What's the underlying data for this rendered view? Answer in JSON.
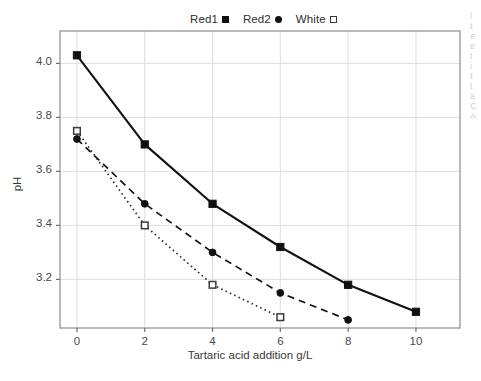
{
  "chart_data": {
    "type": "line",
    "title": "",
    "xlabel": "Tartaric acid addition g/L",
    "ylabel": "pH",
    "x": [
      0,
      2,
      4,
      6,
      8,
      10
    ],
    "xlim": [
      -0.5,
      11.3
    ],
    "ylim": [
      3.02,
      4.12
    ],
    "xticks": [
      "0",
      "2",
      "4",
      "6",
      "8",
      "10"
    ],
    "yticks": [
      "3.2",
      "3.4",
      "3.6",
      "3.8",
      "4.0"
    ],
    "grid": "both",
    "legend_position": "above-center",
    "series": [
      {
        "name": "Red1",
        "marker": "filled-square",
        "linestyle": "solid",
        "color": "#111111",
        "x": [
          0,
          2,
          4,
          6,
          8,
          10
        ],
        "values": [
          4.03,
          3.7,
          3.48,
          3.32,
          3.18,
          3.08
        ]
      },
      {
        "name": "Red2",
        "marker": "filled-circle",
        "linestyle": "dashed",
        "color": "#111111",
        "x": [
          0,
          2,
          4,
          6,
          8
        ],
        "values": [
          3.72,
          3.48,
          3.3,
          3.15,
          3.05
        ]
      },
      {
        "name": "White",
        "marker": "open-square",
        "linestyle": "dotted",
        "color": "#333333",
        "x": [
          0,
          2,
          4,
          6
        ],
        "values": [
          3.75,
          3.4,
          3.18,
          3.06
        ]
      }
    ]
  },
  "legend": {
    "entries": [
      {
        "label": "Red1"
      },
      {
        "label": "Red2"
      },
      {
        "label": "White"
      }
    ]
  },
  "axes": {
    "ylabel": "pH",
    "xlabel": "Tartaric acid addition g/L",
    "ytick_labels": [
      "4.0",
      "3.8",
      "3.6",
      "3.4",
      "3.2"
    ],
    "xtick_labels": [
      "0",
      "2",
      "4",
      "6",
      "8",
      "10"
    ]
  },
  "page_edge": {
    "fragments": [
      "l",
      "t",
      "e",
      "e",
      "t",
      "i",
      "t",
      "t",
      "a",
      "C",
      "A"
    ]
  }
}
